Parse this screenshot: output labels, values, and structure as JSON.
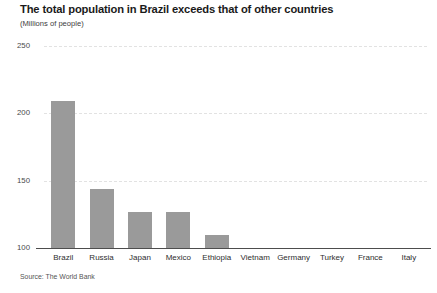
{
  "chart_data": {
    "type": "bar",
    "title": "The total population in Brazil exceeds that of other countries",
    "subtitle": "(Millions of people)",
    "source": "Source: The World Bank",
    "xlabel": "",
    "ylabel": "",
    "ylim": [
      100,
      250
    ],
    "yticks": [
      100,
      150,
      200,
      250
    ],
    "ytick_labels": [
      "100",
      "150",
      "200",
      "250"
    ],
    "grid": true,
    "legend": false,
    "legend_position": "none",
    "bar_color": "#9a9a9a",
    "gridline_color": "#e2e2e2",
    "axis_color": "#4d4d4d",
    "categories": [
      "Brazil",
      "Russia",
      "Japan",
      "Mexico",
      "Ethiopia",
      "Vietnam",
      "Germany",
      "Turkey",
      "France",
      "Italy"
    ],
    "values": [
      209,
      144,
      127,
      127,
      110,
      95,
      83,
      81,
      67,
      60
    ],
    "note": "Y axis is truncated at 100; bars for countries below 100 million are not visible."
  },
  "yticks": [
    {
      "label": "250",
      "value": 250
    },
    {
      "label": "200",
      "value": 200
    },
    {
      "label": "150",
      "value": 150
    },
    {
      "label": "100",
      "value": 100
    }
  ],
  "bars": [
    {
      "label": "Brazil",
      "value": 209
    },
    {
      "label": "Russia",
      "value": 144
    },
    {
      "label": "Japan",
      "value": 127
    },
    {
      "label": "Mexico",
      "value": 127
    },
    {
      "label": "Ethiopia",
      "value": 110
    },
    {
      "label": "Vietnam",
      "value": 95
    },
    {
      "label": "Germany",
      "value": 83
    },
    {
      "label": "Turkey",
      "value": 81
    },
    {
      "label": "France",
      "value": 67
    },
    {
      "label": "Italy",
      "value": 60
    }
  ]
}
